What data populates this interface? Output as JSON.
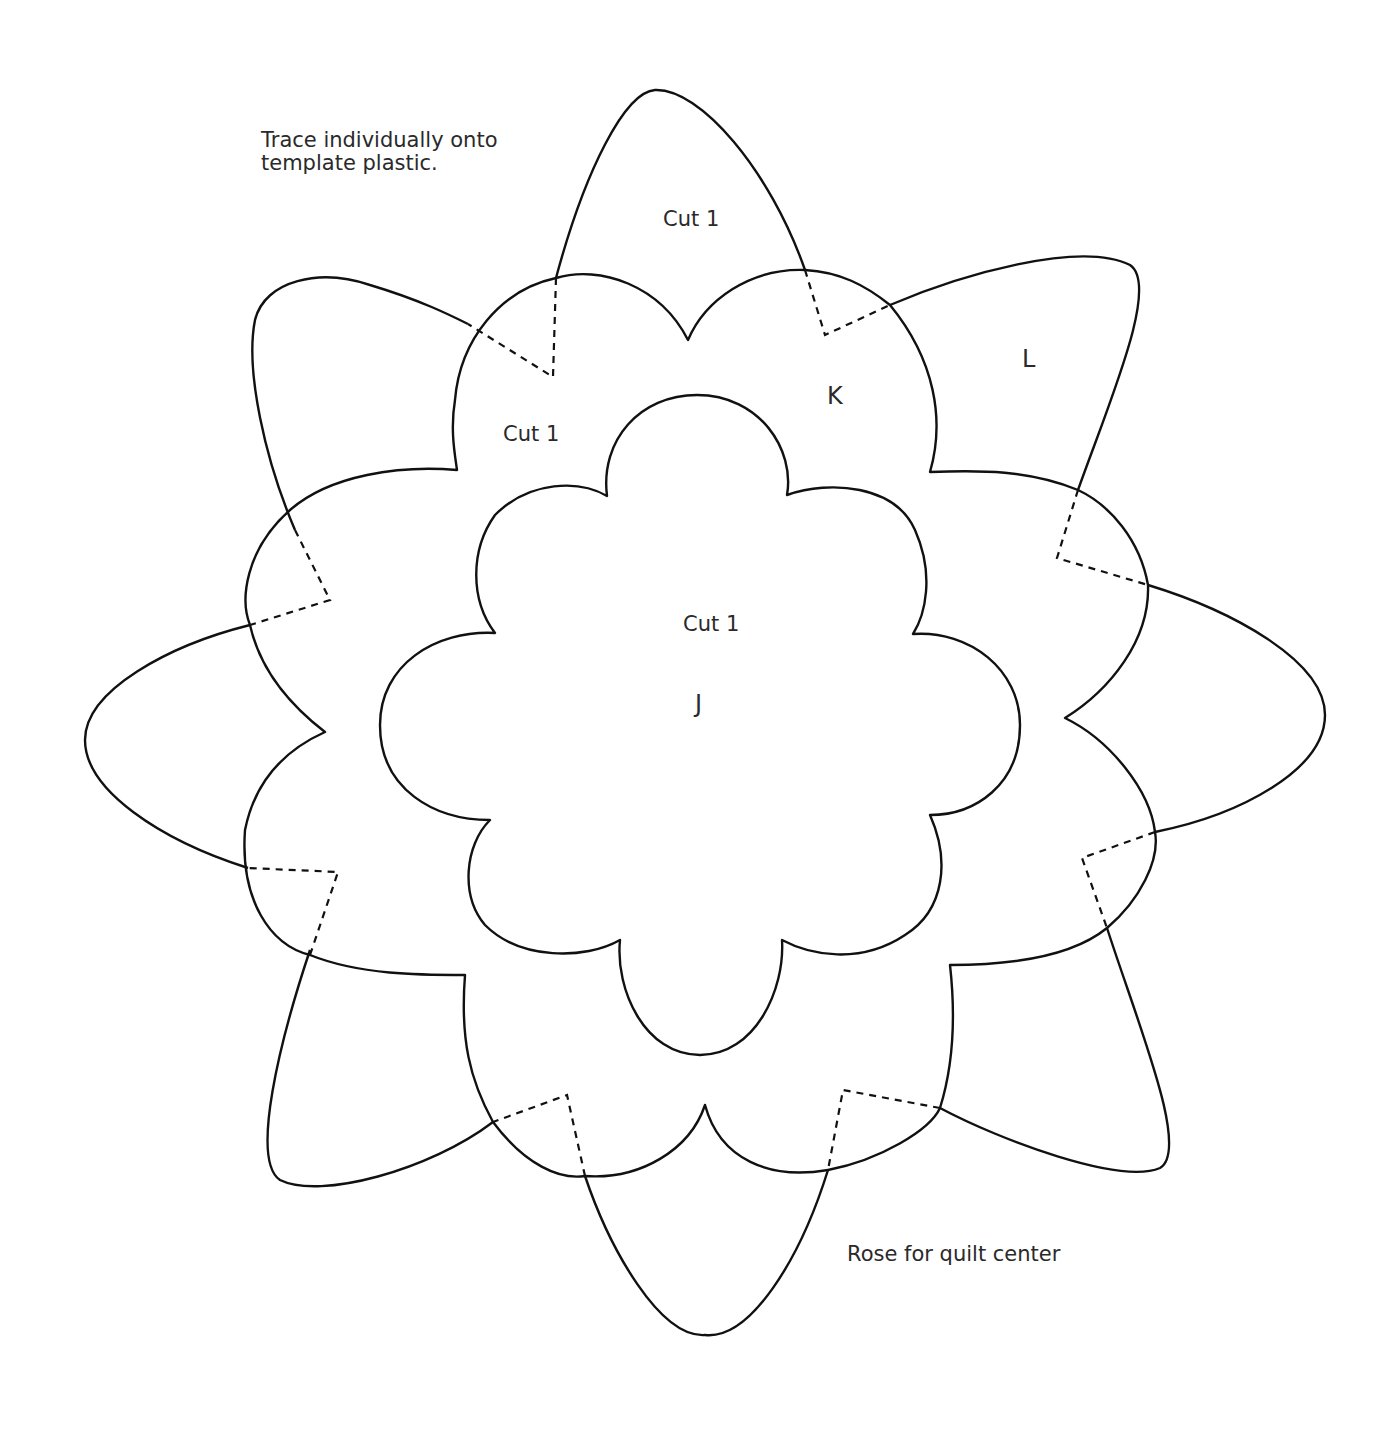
{
  "instructions": {
    "line1": "Trace individually onto",
    "line2": "template plastic."
  },
  "caption": "Rose for quilt center",
  "pieces": {
    "L": {
      "letter": "L",
      "cut_label": "Cut 1"
    },
    "K": {
      "letter": "K",
      "cut_label": "Cut 1"
    },
    "J": {
      "letter": "J",
      "cut_label": "Cut 1"
    }
  },
  "colors": {
    "line": "#111111",
    "text": "#2a2a2a",
    "background": "#ffffff"
  }
}
